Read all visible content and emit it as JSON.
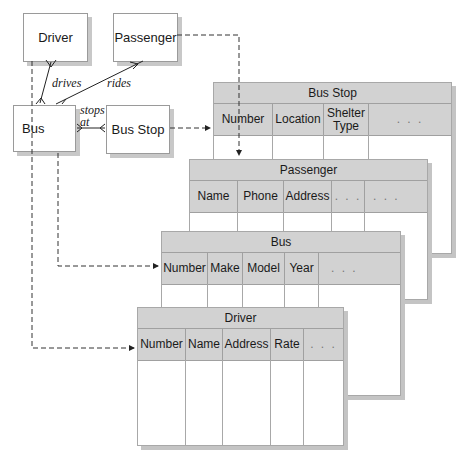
{
  "er_diagram": {
    "entities": [
      {
        "id": "driver",
        "label": "Driver"
      },
      {
        "id": "passenger",
        "label": "Passenger"
      },
      {
        "id": "bus",
        "label": "Bus"
      },
      {
        "id": "bus_stop",
        "label": "Bus Stop"
      }
    ],
    "relationships": [
      {
        "from": "Driver",
        "to": "Bus",
        "label": "drives"
      },
      {
        "from": "Passenger",
        "to": "Bus",
        "label": "rides"
      },
      {
        "from": "Bus",
        "to": "Bus Stop",
        "label_line1": "stops",
        "label_line2": "at"
      }
    ]
  },
  "tables": {
    "bus_stop": {
      "title": "Bus Stop",
      "columns": [
        "Number",
        "Location",
        "Shelter Type",
        ". . ."
      ]
    },
    "passenger": {
      "title": "Passenger",
      "columns": [
        "Name",
        "Phone",
        "Address",
        ". . .",
        ". . ."
      ]
    },
    "bus": {
      "title": "Bus",
      "columns": [
        "Number",
        "Make",
        "Model",
        "Year",
        ". . ."
      ]
    },
    "driver": {
      "title": "Driver",
      "columns": [
        "Number",
        "Name",
        "Address",
        "Rate",
        ". . ."
      ]
    }
  },
  "colors": {
    "header_fill": "#d2d2d2",
    "border": "#a0a0a0",
    "shadow": "#c4c4c4",
    "line": "#222222"
  }
}
